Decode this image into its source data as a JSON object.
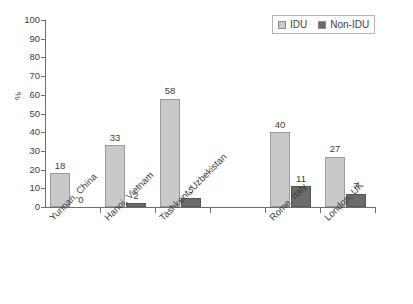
{
  "chart_data": {
    "type": "bar",
    "title": "",
    "xlabel": "",
    "ylabel": "%",
    "ylim": [
      0,
      100
    ],
    "ytick_step": 10,
    "yticks": [
      100,
      90,
      80,
      70,
      60,
      50,
      40,
      30,
      20,
      10,
      0
    ],
    "grid": false,
    "legend_position": "top-right",
    "categories": [
      "Yunnan, China",
      "Hanoi, Vietnam",
      "Tashkent, Uzbekistan",
      "",
      "Rome, Italy",
      "London, UK"
    ],
    "series": [
      {
        "name": "IDU",
        "color": "#c9c9c9",
        "values": [
          18,
          33,
          58,
          null,
          40,
          27
        ]
      },
      {
        "name": "Non-IDU",
        "color": "#6b6b6b",
        "values": [
          0,
          2,
          5,
          null,
          11,
          7
        ]
      }
    ]
  },
  "legend": {
    "entries": [
      {
        "label": "IDU"
      },
      {
        "label": "Non-IDU"
      }
    ]
  },
  "axis": {
    "y_title": "%",
    "y_ticks": [
      "100",
      "90",
      "80",
      "70",
      "60",
      "50",
      "40",
      "30",
      "20",
      "10",
      "0"
    ]
  },
  "categories": [
    {
      "label": "Yunnan, China",
      "idu": {
        "value": 18,
        "display": "18",
        "drawn": true
      },
      "nonidu": {
        "value": 0,
        "display": "0",
        "drawn": false
      }
    },
    {
      "label": "Hanoi, Vietnam",
      "idu": {
        "value": 33,
        "display": "33",
        "drawn": true
      },
      "nonidu": {
        "value": 2,
        "display": "2",
        "drawn": true
      }
    },
    {
      "label": "Tashkent, Uzbekistan",
      "idu": {
        "value": 58,
        "display": "58",
        "drawn": true
      },
      "nonidu": {
        "value": 5,
        "display": "5",
        "drawn": true
      }
    },
    {
      "label": "",
      "idu": {
        "value": null,
        "display": "",
        "drawn": false
      },
      "nonidu": {
        "value": null,
        "display": "",
        "drawn": false
      }
    },
    {
      "label": "Rome, Italy",
      "idu": {
        "value": 40,
        "display": "40",
        "drawn": true
      },
      "nonidu": {
        "value": 11,
        "display": "11",
        "drawn": true
      }
    },
    {
      "label": "London, UK",
      "idu": {
        "value": 27,
        "display": "27",
        "drawn": true
      },
      "nonidu": {
        "value": 7,
        "display": "7",
        "drawn": true
      }
    }
  ]
}
